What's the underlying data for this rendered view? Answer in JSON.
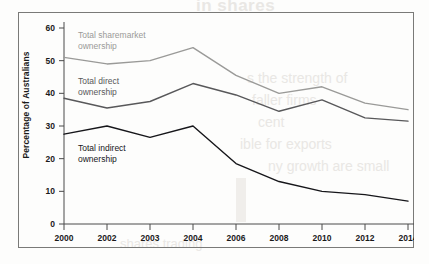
{
  "figure": {
    "frame_border_color": "#7a7a78",
    "background": "#fdfdfc"
  },
  "bleed_through": {
    "title": "in shares",
    "line1": "s the strength of",
    "line2": "faller firms",
    "line3": "cent",
    "line4": "ible for exports",
    "line5": "ny growth are small",
    "footer": "shares trading"
  },
  "chart_data": {
    "type": "line",
    "title": "",
    "subtitle": "",
    "xlabel": "",
    "ylabel": "Percentage of Australians",
    "categories": [
      "2000",
      "2002",
      "2003",
      "2004",
      "2006",
      "2008",
      "2010",
      "2012",
      "2014"
    ],
    "ylim": [
      0,
      60
    ],
    "yticks": [
      0,
      10,
      20,
      30,
      40,
      50,
      60
    ],
    "ytick_labels": [
      "0",
      "10",
      "20",
      "30",
      "40",
      "50",
      "60"
    ],
    "grid": false,
    "legend_position": "inline-annotations",
    "series": [
      {
        "name": "Total sharemarket ownership",
        "label_line1": "Total sharemarket",
        "label_line2": "ownership",
        "color": "#9a9a98",
        "values": [
          51,
          49,
          50,
          54,
          45.5,
          40,
          42,
          37,
          35
        ]
      },
      {
        "name": "Total direct ownership",
        "label_line1": "Total direct",
        "label_line2": "ownership",
        "color": "#58585a",
        "values": [
          38.5,
          35.5,
          37.5,
          43,
          39.5,
          34.5,
          38,
          32.5,
          31.5
        ]
      },
      {
        "name": "Total indirect ownership",
        "label_line1": "Total indirect",
        "label_line2": "ownership",
        "color": "#16161a",
        "values": [
          27.5,
          30,
          26.5,
          30,
          18.5,
          13,
          10,
          9,
          7
        ]
      }
    ]
  }
}
